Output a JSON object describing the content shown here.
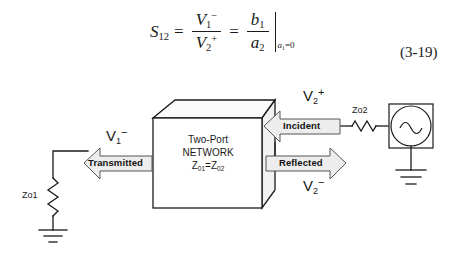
{
  "equation": {
    "lhs": "S",
    "lhs_sub": "12",
    "eq1": "=",
    "frac1_num": "V",
    "frac1_num_sub": "1",
    "frac1_num_sup": "−",
    "frac1_den": "V",
    "frac1_den_sub": "2",
    "frac1_den_sup": "+",
    "eq2": "=",
    "frac2_num": "b",
    "frac2_num_sub": "1",
    "frac2_den": "a",
    "frac2_den_sub": "2",
    "condition": "a",
    "condition_sub": "1",
    "condition_rest": "=0",
    "number": "(3-19)"
  },
  "figure": {
    "network_box": {
      "line1": "Two-Port",
      "line2": "NETWORK",
      "z_prefix": "Z",
      "z_sub1": "01",
      "z_eq": "=",
      "z_sub2": "02"
    },
    "arrows": {
      "transmitted": "Transmitted",
      "incident": "Incident",
      "reflected": "Reflected"
    },
    "labels": {
      "v1_minus_var": "V",
      "v1_minus_sub": "1",
      "v1_minus_sup": "−",
      "v2_plus_var": "V",
      "v2_plus_sub": "2",
      "v2_plus_sup": "+",
      "v2_minus_var": "V",
      "v2_minus_sub": "2",
      "v2_minus_sup": "−",
      "zo1": "Zo1",
      "zo2": "Zo2"
    },
    "source": {
      "symbol": "ac-source-sine"
    }
  },
  "colors": {
    "ink": "#1a1a1a",
    "arrow_fill": "#eeeeee",
    "box_top_fill": "#fbfbfb",
    "box_side_fill": "#f2f2f2",
    "page_bg": "#ffffff"
  }
}
